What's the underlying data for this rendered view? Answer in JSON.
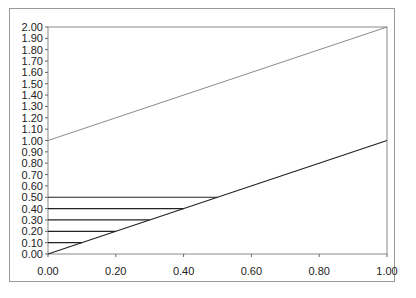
{
  "chart_data": {
    "type": "line",
    "title": "",
    "xlabel": "",
    "ylabel": "",
    "xlim": [
      0,
      1
    ],
    "ylim": [
      0,
      2
    ],
    "x_ticks": [
      "0.00",
      "0.20",
      "0.40",
      "0.60",
      "0.80",
      "1.00"
    ],
    "y_ticks": [
      "0.00",
      "0.10",
      "0.20",
      "0.30",
      "0.40",
      "0.50",
      "0.60",
      "0.70",
      "0.80",
      "0.90",
      "1.00",
      "1.10",
      "1.20",
      "1.30",
      "1.40",
      "1.50",
      "1.60",
      "1.70",
      "1.80",
      "1.90",
      "2.00"
    ],
    "grid": false,
    "legend": null,
    "series": [
      {
        "name": "upper line",
        "color": "#8a8a8a",
        "x": [
          0,
          1
        ],
        "y": [
          1.0,
          2.0
        ]
      },
      {
        "name": "y = x",
        "color": "#222222",
        "x": [
          0,
          1
        ],
        "y": [
          0.0,
          1.0
        ]
      },
      {
        "name": "h 0.10",
        "color": "#222222",
        "x": [
          0,
          0.1
        ],
        "y": [
          0.1,
          0.1
        ]
      },
      {
        "name": "h 0.20",
        "color": "#222222",
        "x": [
          0,
          0.2
        ],
        "y": [
          0.2,
          0.2
        ]
      },
      {
        "name": "h 0.30",
        "color": "#222222",
        "x": [
          0,
          0.3
        ],
        "y": [
          0.3,
          0.3
        ]
      },
      {
        "name": "h 0.40",
        "color": "#222222",
        "x": [
          0,
          0.4
        ],
        "y": [
          0.4,
          0.4
        ]
      },
      {
        "name": "h 0.50",
        "color": "#222222",
        "x": [
          0,
          0.5
        ],
        "y": [
          0.5,
          0.5
        ]
      }
    ]
  }
}
